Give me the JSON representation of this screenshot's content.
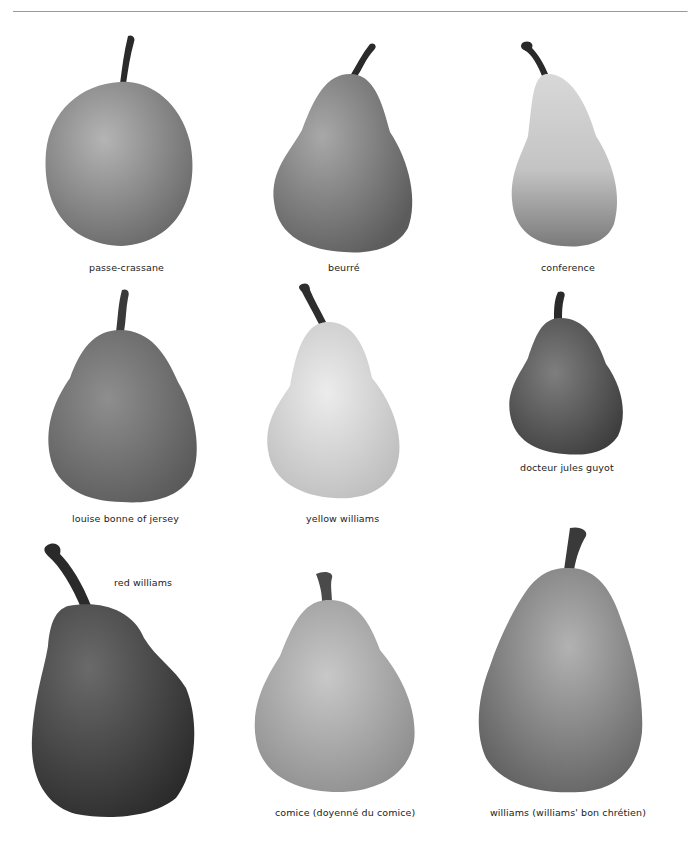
{
  "page": {
    "rule_color": "#9a9a9a",
    "background": "#ffffff"
  },
  "pears": [
    {
      "id": "passe-crassane",
      "label": "passe-crassane",
      "tone": "#8a8a8a",
      "stem": "#2a2a2a"
    },
    {
      "id": "beurre",
      "label": "beurré",
      "tone": "#7e7e7e",
      "stem": "#2a2a2a"
    },
    {
      "id": "conference",
      "label": "conference",
      "tone": "#a8a8a8",
      "stem": "#2a2a2a"
    },
    {
      "id": "louise-bonne-of-jersey",
      "label": "louise bonne of jersey",
      "tone": "#7a7a7a",
      "stem": "#3a3a3a"
    },
    {
      "id": "yellow-williams",
      "label": "yellow williams",
      "tone": "#d4d4d4",
      "stem": "#2e2e2e"
    },
    {
      "id": "docteur-jules-guyot",
      "label": "docteur jules guyot",
      "tone": "#6c6c6c",
      "stem": "#2a2a2a"
    },
    {
      "id": "red-williams",
      "label": "red williams",
      "tone": "#4a4a4a",
      "stem": "#2a2a2a"
    },
    {
      "id": "comice",
      "label": "comice (doyenné du comice)",
      "tone": "#a6a6a6",
      "stem": "#4a4a4a"
    },
    {
      "id": "williams",
      "label": "williams (williams' bon chrétien)",
      "tone": "#8e8e8e",
      "stem": "#3a3a3a"
    }
  ]
}
